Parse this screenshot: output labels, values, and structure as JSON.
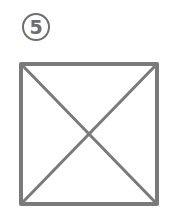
{
  "figure": {
    "label": "5",
    "label_style": "circled-number",
    "shape": "square-with-diagonals",
    "colors": {
      "stroke": "#7a7a7a",
      "label": "#6e6e6e",
      "background": "#ffffff"
    }
  }
}
